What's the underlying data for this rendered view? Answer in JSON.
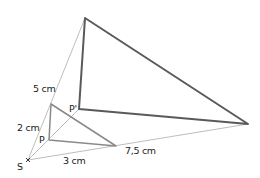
{
  "figure": {
    "center": {
      "label": "S",
      "x": 28,
      "y": 160
    },
    "small_triangle": {
      "vertices": [
        {
          "label": "",
          "x": 51,
          "y": 104
        },
        {
          "label": "P",
          "x": 49,
          "y": 140
        },
        {
          "label": "",
          "x": 116,
          "y": 146
        }
      ]
    },
    "large_triangle": {
      "vertices": [
        {
          "label": "",
          "x": 85,
          "y": 18
        },
        {
          "label": "P'",
          "x": 79,
          "y": 109
        },
        {
          "label": "",
          "x": 248,
          "y": 124
        }
      ]
    },
    "labels": {
      "S": "S",
      "P": "P",
      "P_prime": "P'",
      "seg_top_short": "2 cm",
      "seg_top_long": "5 cm",
      "seg_bottom_short": "3 cm",
      "seg_bottom_long": "7,5 cm"
    },
    "colors": {
      "rays": "#b5b5b5",
      "small_triangle": "#8a8a8a",
      "large_triangle": "#5a5a5a",
      "text": "#222222"
    }
  }
}
